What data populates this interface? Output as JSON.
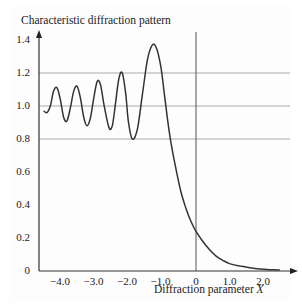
{
  "chart_data": {
    "type": "line",
    "title": "Characteristic diffraction pattern",
    "xlabel": "Diffraction parameter X",
    "xlabel_text": "Diffraction parameter ",
    "xlabel_var": "X",
    "ylabel": "",
    "xlim": [
      -4.55,
      2.6
    ],
    "ylim": [
      0,
      1.4
    ],
    "x_ticks": [
      -4.0,
      -3.0,
      -2.0,
      -1.0,
      0,
      1.0,
      2.0
    ],
    "x_tick_labels": [
      "−4.0",
      "−3.0",
      "−2.0",
      "−1.0",
      "0",
      "1.0",
      "2.0"
    ],
    "y_ticks": [
      0,
      0.2,
      0.4,
      0.6,
      0.8,
      1.0,
      1.2,
      1.4
    ],
    "y_tick_labels": [
      "0",
      "0.2",
      "0.4",
      "0.6",
      "0.8",
      "1.0",
      "1.2",
      "1.4"
    ],
    "gridlines_y": [
      0.8,
      1.0,
      1.2
    ],
    "vertical_line_x": 0,
    "grid": true,
    "legend": null,
    "series": [
      {
        "name": "Characteristic diffraction pattern",
        "x": [
          -4.55,
          -4.45,
          -4.35,
          -4.25,
          -4.15,
          -4.05,
          -3.95,
          -3.85,
          -3.75,
          -3.65,
          -3.55,
          -3.45,
          -3.35,
          -3.25,
          -3.15,
          -3.05,
          -2.95,
          -2.85,
          -2.75,
          -2.6,
          -2.5,
          -2.4,
          -2.3,
          -2.2,
          -2.1,
          -2.02,
          -1.9,
          -1.75,
          -1.6,
          -1.45,
          -1.3,
          -1.18,
          -1.05,
          -0.95,
          -0.85,
          -0.75,
          -0.6,
          -0.45,
          -0.3,
          -0.15,
          0,
          0.2,
          0.4,
          0.6,
          0.8,
          1.0,
          1.3,
          1.6,
          1.9,
          2.2,
          2.5
        ],
        "values": [
          0.97,
          0.96,
          1.0,
          1.09,
          1.11,
          1.04,
          0.93,
          0.91,
          0.99,
          1.09,
          1.12,
          1.05,
          0.93,
          0.88,
          0.93,
          1.05,
          1.15,
          1.13,
          1.01,
          0.87,
          0.88,
          1.02,
          1.17,
          1.2,
          1.08,
          0.91,
          0.8,
          0.86,
          1.07,
          1.28,
          1.37,
          1.35,
          1.24,
          1.08,
          0.92,
          0.78,
          0.62,
          0.48,
          0.38,
          0.3,
          0.24,
          0.18,
          0.13,
          0.09,
          0.065,
          0.045,
          0.03,
          0.02,
          0.012,
          0.008,
          0.006
        ],
        "color": "#333333"
      }
    ]
  }
}
